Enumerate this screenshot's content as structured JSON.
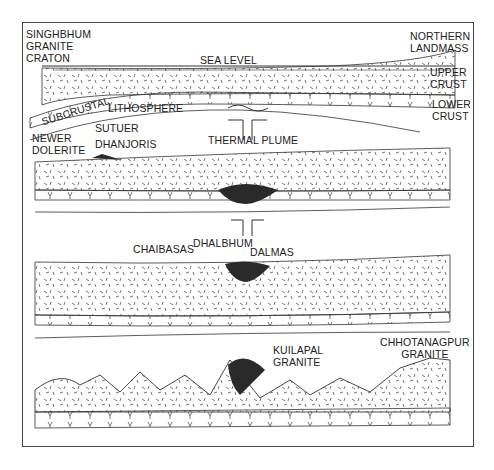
{
  "figure": {
    "type": "geological cross-section diagram",
    "panels": 4
  },
  "labels": {
    "singhbhum": [
      "SINGHBHUM",
      "GRANITE",
      "CRATON"
    ],
    "sea_level": "SEA LEVEL",
    "northern": [
      "NORTHERN",
      "LANDMASS"
    ],
    "upper_crust": [
      "UPPER",
      "CRUST"
    ],
    "lower_crust": [
      "LOWER",
      "CRUST"
    ],
    "subcrustal": "SUBCRUSTAL",
    "lithosphere": "LITHOSPHERE",
    "newer_dolerite": [
      "NEWER",
      "DOLERITE"
    ],
    "sutuer": "SUTUER",
    "dhanjoris": "DHANJORIS",
    "thermal_plume": "THERMAL PLUME",
    "chaibasas": "CHAIBASAS",
    "dhalbhum": "DHALBHUM",
    "dalmas": "DALMAS",
    "kuilapal": [
      "KUILAPAL",
      "GRANITE"
    ],
    "chhotanagpur": [
      "CHHOTANAGPUR",
      "GRANITE"
    ]
  },
  "colors": {
    "line": "#333333",
    "fill_dark": "#2a2a2a",
    "background": "#ffffff"
  }
}
